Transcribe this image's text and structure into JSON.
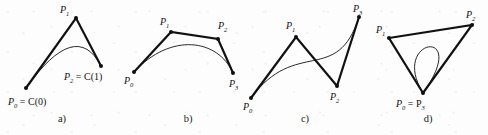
{
  "figure": {
    "background_color": "#fdfdfd",
    "stroke_color": "#111111",
    "polygon_width": 2.2,
    "curve_width": 0.9,
    "width": 488,
    "height": 135
  },
  "panels": [
    {
      "id": "a",
      "caption": "a)",
      "caption_pos": {
        "x": 62,
        "y": 122
      },
      "degree": 2,
      "points": [
        {
          "name": "P0",
          "label_main": "P",
          "label_sub": "0",
          "label_extra": " = C(0)",
          "x": 26,
          "y": 88,
          "label_x": 8,
          "label_y": 105,
          "dot": true
        },
        {
          "name": "P1",
          "label_main": "P",
          "label_sub": "1",
          "label_extra": "",
          "x": 76,
          "y": 18,
          "label_x": 60,
          "label_y": 13,
          "dot": true
        },
        {
          "name": "P2",
          "label_main": "P",
          "label_sub": "2",
          "label_extra": " = C(1)",
          "x": 101,
          "y": 66,
          "label_x": 64,
          "label_y": 80,
          "dot": true
        }
      ],
      "polygon": "26,88 76,18 101,66",
      "curve": "M26,88 Q76,18 101,66",
      "closed": false
    },
    {
      "id": "b",
      "caption": "b)",
      "caption_pos": {
        "x": 188,
        "y": 122
      },
      "degree": 3,
      "points": [
        {
          "name": "P0",
          "label_main": "P",
          "label_sub": "0",
          "label_extra": "",
          "x": 134,
          "y": 72,
          "label_x": 124,
          "label_y": 84,
          "dot": true
        },
        {
          "name": "P1",
          "label_main": "P",
          "label_sub": "1",
          "label_extra": "",
          "x": 171,
          "y": 32,
          "label_x": 160,
          "label_y": 25,
          "dot": true
        },
        {
          "name": "P2",
          "label_main": "P",
          "label_sub": "2",
          "label_extra": "",
          "x": 218,
          "y": 39,
          "label_x": 218,
          "label_y": 29,
          "dot": true
        },
        {
          "name": "P3",
          "label_main": "P",
          "label_sub": "3",
          "label_extra": "",
          "x": 233,
          "y": 73,
          "label_x": 229,
          "label_y": 87,
          "dot": true
        }
      ],
      "polygon": "134,72 171,32 218,39 233,73",
      "curve": "M134,72 C171,32 218,39 233,73",
      "closed": false
    },
    {
      "id": "c",
      "caption": "c)",
      "caption_pos": {
        "x": 305,
        "y": 122
      },
      "degree": 3,
      "points": [
        {
          "name": "P0",
          "label_main": "P",
          "label_sub": "0",
          "label_extra": "",
          "x": 251,
          "y": 98,
          "label_x": 243,
          "label_y": 110,
          "dot": true
        },
        {
          "name": "P1",
          "label_main": "P",
          "label_sub": "1",
          "label_extra": "",
          "x": 296,
          "y": 37,
          "label_x": 286,
          "label_y": 29,
          "dot": true
        },
        {
          "name": "P2",
          "label_main": "P",
          "label_sub": "2",
          "label_extra": "",
          "x": 337,
          "y": 86,
          "label_x": 330,
          "label_y": 100,
          "dot": true
        },
        {
          "name": "P3",
          "label_main": "P",
          "label_sub": "3",
          "label_extra": "",
          "x": 359,
          "y": 17,
          "label_x": 353,
          "label_y": 12,
          "dot": true
        }
      ],
      "polygon": "251,98 296,37 337,86 359,17",
      "curve": "M251,98 C296,37 337,86 359,17",
      "closed": false
    },
    {
      "id": "d",
      "caption": "d)",
      "caption_pos": {
        "x": 428,
        "y": 122
      },
      "degree": 3,
      "points": [
        {
          "name": "P1",
          "label_main": "P",
          "label_sub": "1",
          "label_extra": "",
          "x": 389,
          "y": 38,
          "label_x": 376,
          "label_y": 33,
          "dot": true
        },
        {
          "name": "P2",
          "label_main": "P",
          "label_sub": "2",
          "label_extra": "",
          "x": 472,
          "y": 25,
          "label_x": 466,
          "label_y": 18,
          "dot": true
        },
        {
          "name": "P0P3",
          "label_main": "P",
          "label_sub": "0",
          "label_extra": " = P",
          "label_extra_sub": "3",
          "x": 423,
          "y": 93,
          "label_x": 396,
          "label_y": 107,
          "dot": true
        }
      ],
      "polygon": "423,93 389,38 472,25 423,93",
      "curve": "M423,93 C389,38 472,25 423,93",
      "closed": true
    }
  ]
}
